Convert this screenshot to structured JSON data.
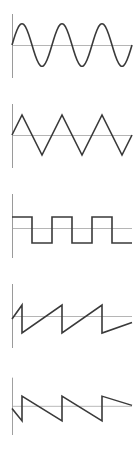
{
  "figure": {
    "title": "",
    "panel_count": 5,
    "background_color": "#ffffff",
    "wave_color": "#3a3a3a",
    "axis_color": "#9a9a9a",
    "baseline_color": "#b5b5b5"
  },
  "chart_data": [
    {
      "type": "line",
      "name": "sine-wave",
      "title": "",
      "xlabel": "",
      "ylabel": "",
      "xlim": [
        0,
        3
      ],
      "ylim": [
        -1,
        1
      ],
      "grid": false,
      "legend": "none",
      "waveform": "sine",
      "cycles": 3,
      "amplitude": 1,
      "phase": 0,
      "x": [
        0,
        0.0833,
        0.1667,
        0.25,
        0.3333,
        0.4167,
        0.5,
        0.5833,
        0.6667,
        0.75,
        0.8333,
        0.9167,
        1.0,
        1.0833,
        1.1667,
        1.25,
        1.3333,
        1.4167,
        1.5,
        1.5833,
        1.6667,
        1.75,
        1.8333,
        1.9167,
        2.0,
        2.0833,
        2.1667,
        2.25,
        2.3333,
        2.4167,
        2.5,
        2.5833,
        2.6667,
        2.75,
        2.8333,
        2.9167,
        3.0
      ],
      "values": [
        0,
        0.5,
        0.866,
        1,
        0.866,
        0.5,
        0,
        -0.5,
        -0.866,
        -1,
        -0.866,
        -0.5,
        0,
        0.5,
        0.866,
        1,
        0.866,
        0.5,
        0,
        -0.5,
        -0.866,
        -1,
        -0.866,
        -0.5,
        0,
        0.5,
        0.866,
        1,
        0.866,
        0.5,
        0,
        -0.5,
        -0.866,
        -1,
        -0.866,
        -0.5,
        0
      ]
    },
    {
      "type": "line",
      "name": "triangle-wave",
      "title": "",
      "xlabel": "",
      "ylabel": "",
      "xlim": [
        0,
        3
      ],
      "ylim": [
        -1,
        1
      ],
      "grid": false,
      "legend": "none",
      "waveform": "triangle",
      "cycles": 3,
      "amplitude": 1,
      "phase": 0,
      "x": [
        0,
        0.25,
        0.75,
        1.25,
        1.75,
        2.25,
        2.75,
        3.0
      ],
      "values": [
        0,
        1,
        -1,
        1,
        -1,
        1,
        -1,
        0
      ]
    },
    {
      "type": "line",
      "name": "square-wave",
      "title": "",
      "xlabel": "",
      "ylabel": "",
      "xlim": [
        0,
        3
      ],
      "ylim": [
        -1,
        1
      ],
      "grid": false,
      "legend": "none",
      "waveform": "square",
      "cycles": 3,
      "amplitude": 1,
      "duty_cycle": 0.5,
      "phase": 0,
      "x": [
        0,
        0.5,
        0.5,
        1.0,
        1.0,
        1.5,
        1.5,
        2.0,
        2.0,
        2.5,
        2.5,
        3.0
      ],
      "values": [
        1,
        1,
        -1,
        -1,
        1,
        1,
        -1,
        -1,
        1,
        1,
        -1,
        -1
      ]
    },
    {
      "type": "line",
      "name": "sawtooth-rising-wave",
      "title": "",
      "xlabel": "",
      "ylabel": "",
      "xlim": [
        0,
        3
      ],
      "ylim": [
        -1,
        1
      ],
      "grid": false,
      "legend": "none",
      "waveform": "sawtooth-rising",
      "cycles": 3,
      "amplitude": 1,
      "phase": 0,
      "x": [
        0,
        0.25,
        0.25,
        1.25,
        1.25,
        2.25,
        2.25,
        3.0
      ],
      "values": [
        0,
        1,
        -1,
        1,
        -1,
        1,
        -1,
        -0.25
      ]
    },
    {
      "type": "line",
      "name": "sawtooth-falling-wave",
      "title": "",
      "xlabel": "",
      "ylabel": "",
      "xlim": [
        0,
        3
      ],
      "ylim": [
        -1,
        1
      ],
      "grid": false,
      "legend": "none",
      "waveform": "sawtooth-falling",
      "cycles": 3,
      "amplitude": 1,
      "phase": 0,
      "x": [
        0,
        0.25,
        0.25,
        1.25,
        1.25,
        2.25,
        2.25,
        3.0
      ],
      "values": [
        0,
        -1,
        1,
        -1,
        1,
        -1,
        1,
        0.25
      ]
    }
  ]
}
